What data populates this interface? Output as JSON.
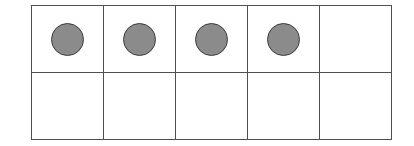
{
  "figure": {
    "name": "ten-frame",
    "rows": 2,
    "columns": 5,
    "total_cells": 10,
    "filled_count": 4,
    "empty_count": 6
  },
  "colors": {
    "background": "#ffffff",
    "grid_border": "#4e4e4e",
    "counter_fill": "#8b8b8b",
    "counter_outline": "#3b3b3b"
  },
  "cells": [
    {
      "id": "cell-r1c1",
      "row": 1,
      "column": 1,
      "filled": true,
      "counter_label": "counter"
    },
    {
      "id": "cell-r1c2",
      "row": 1,
      "column": 2,
      "filled": true,
      "counter_label": "counter"
    },
    {
      "id": "cell-r1c3",
      "row": 1,
      "column": 3,
      "filled": true,
      "counter_label": "counter"
    },
    {
      "id": "cell-r1c4",
      "row": 1,
      "column": 4,
      "filled": true,
      "counter_label": "counter"
    },
    {
      "id": "cell-r1c5",
      "row": 1,
      "column": 5,
      "filled": false,
      "counter_label": ""
    },
    {
      "id": "cell-r2c1",
      "row": 2,
      "column": 1,
      "filled": false,
      "counter_label": ""
    },
    {
      "id": "cell-r2c2",
      "row": 2,
      "column": 2,
      "filled": false,
      "counter_label": ""
    },
    {
      "id": "cell-r2c3",
      "row": 2,
      "column": 3,
      "filled": false,
      "counter_label": ""
    },
    {
      "id": "cell-r2c4",
      "row": 2,
      "column": 4,
      "filled": false,
      "counter_label": ""
    },
    {
      "id": "cell-r2c5",
      "row": 2,
      "column": 5,
      "filled": false,
      "counter_label": ""
    }
  ]
}
